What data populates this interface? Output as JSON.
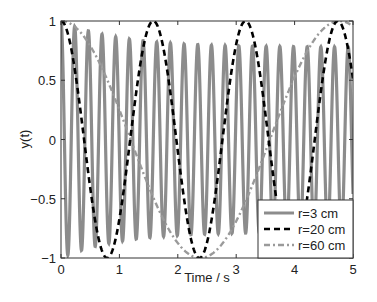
{
  "chart_data": {
    "type": "line",
    "title": "",
    "xlabel": "Time / s",
    "ylabel": "y(t)",
    "xlim": [
      0,
      5
    ],
    "ylim": [
      -1,
      1
    ],
    "xticks": [
      0,
      1,
      2,
      3,
      4,
      5
    ],
    "xtick_labels": [
      "0",
      "1",
      "2",
      "3",
      "4",
      "5"
    ],
    "yticks": [
      -1,
      -0.5,
      0,
      0.5,
      1
    ],
    "ytick_labels": [
      "−1",
      "−0.5",
      "0",
      "0.5",
      "1"
    ],
    "grid": false,
    "legend_position": "lower right",
    "series": [
      {
        "name": "r=3 cm",
        "style": "solid",
        "color": "#8c8c8c",
        "width": 3.2,
        "model": {
          "frequency_hz": 4.27,
          "amplitude_start": 1.0,
          "amplitude_end": 0.78,
          "decay_tau_s": 1.0,
          "phase": 0
        }
      },
      {
        "name": "r=20 cm",
        "style": "dashed",
        "color": "#000000",
        "width": 2.6,
        "model": {
          "period_s": 1.58,
          "amplitude": 1.0,
          "phase": 0
        }
      },
      {
        "name": "r=60 cm",
        "style": "dashdot",
        "color": "#9a9a9a",
        "width": 2.4,
        "model": {
          "period_s": 4.77,
          "amplitude": 1.0,
          "phase": 0
        }
      }
    ]
  },
  "legend": {
    "items": [
      {
        "label": "r=3 cm"
      },
      {
        "label": "r=20 cm"
      },
      {
        "label": "r=60 cm"
      }
    ]
  }
}
